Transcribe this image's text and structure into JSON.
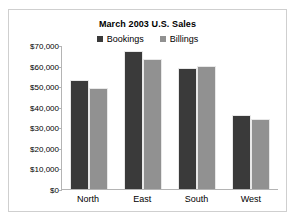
{
  "chart_data": {
    "type": "bar",
    "title": "March 2003 U.S. Sales",
    "xlabel": "",
    "ylabel": "",
    "categories": [
      "North",
      "East",
      "South",
      "West"
    ],
    "series": [
      {
        "name": "Bookings",
        "color": "#3a3a3a",
        "values": [
          53000,
          67000,
          59000,
          36000
        ]
      },
      {
        "name": "Billings",
        "color": "#919191",
        "values": [
          49000,
          63000,
          60000,
          34000
        ]
      }
    ],
    "ylim": [
      0,
      70000
    ],
    "ytick_values": [
      0,
      10000,
      20000,
      30000,
      40000,
      50000,
      60000,
      70000
    ],
    "ytick_labels": [
      "$0",
      "$10,000",
      "$20,000",
      "$30,000",
      "$40,000",
      "$50,000",
      "$60,000",
      "$70,000"
    ],
    "grid": false,
    "legend_position": "top-center"
  }
}
